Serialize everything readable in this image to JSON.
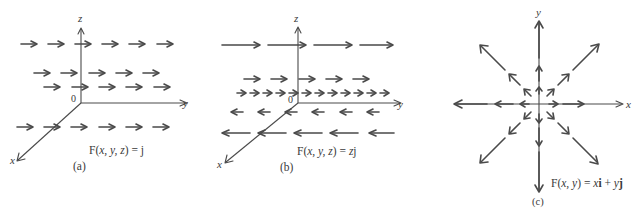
{
  "figure": {
    "panels": [
      {
        "id": "a",
        "caption": "(a)",
        "formula": "F(x, y, z) = j",
        "formula_parts": {
          "prefix": "F(",
          "vars": "x, y, z",
          "suffix": ") = j"
        },
        "axes": {
          "z_label": "z",
          "y_label": "y",
          "x_label": "x",
          "origin_label": "0"
        },
        "description": "Constant vector field: all arrows point in +y direction with equal length"
      },
      {
        "id": "b",
        "caption": "(b)",
        "formula": "F(x, y, z) = zj",
        "formula_parts": {
          "prefix": "F(",
          "vars": "x, y, z",
          "suffix": ") = ",
          "var2": "z",
          "suffix2": "j"
        },
        "axes": {
          "z_label": "z",
          "y_label": "y",
          "x_label": "x",
          "origin_label": "0"
        },
        "description": "Arrows point +y above the xy-plane and -y below, length proportional to |z|"
      },
      {
        "id": "c",
        "caption": "(c)",
        "formula": "F(x, y) = xi + yj",
        "formula_parts": {
          "prefix": "F(",
          "vars": "x, y",
          "suffix": ") = ",
          "t1": "x",
          "i": "i",
          "plus": " + ",
          "t2": "y",
          "j": "j"
        },
        "axes": {
          "y_label": "y",
          "x_label": "x"
        },
        "description": "Radial field: arrows point away from origin with length proportional to distance"
      }
    ],
    "colors": {
      "ink": "#4a4a4a",
      "text": "#3a3a3a",
      "background": "#ffffff"
    }
  }
}
